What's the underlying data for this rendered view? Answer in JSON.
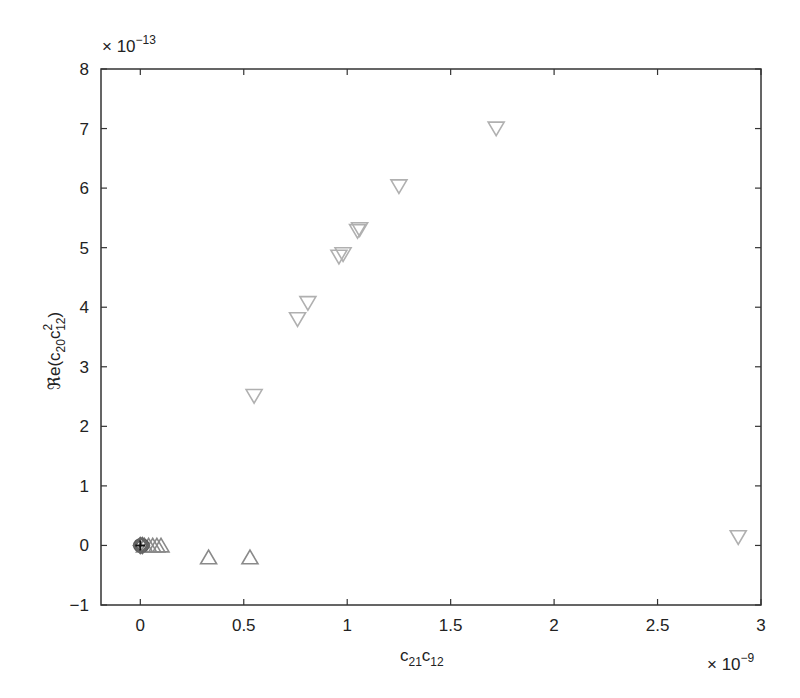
{
  "chart_data": {
    "type": "scatter",
    "title": "",
    "xlabel": "c21c12",
    "xlabel_parts": {
      "base1": "c",
      "sub1": "21",
      "base2": "c",
      "sub2": "12"
    },
    "ylabel": "Re(c20c^2_12)",
    "ylabel_parts": {
      "prefix": "ℜe(c",
      "sub1": "20",
      "base2": "c",
      "sup2": "2",
      "sub2": "12",
      "suffix": ")"
    },
    "x_multiplier": "× 10",
    "x_multiplier_exp": "−9",
    "y_multiplier": "× 10",
    "y_multiplier_exp": "−13",
    "xlim": [
      -0.19,
      3.0
    ],
    "ylim": [
      -1,
      8
    ],
    "xticks": [
      0,
      0.5,
      1,
      1.5,
      2,
      2.5,
      3
    ],
    "xtick_labels": [
      "0",
      "0.5",
      "1",
      "1.5",
      "2",
      "2.5",
      "3"
    ],
    "yticks": [
      -1,
      0,
      1,
      2,
      3,
      4,
      5,
      6,
      7,
      8
    ],
    "ytick_labels": [
      "−1",
      "0",
      "1",
      "2",
      "3",
      "4",
      "5",
      "6",
      "7",
      "8"
    ],
    "grid": false,
    "legend": null,
    "series": [
      {
        "name": "down-triangles",
        "marker": "triangle-down",
        "color": "#b0b0b0",
        "points": [
          [
            0.55,
            2.51
          ],
          [
            0.76,
            3.8
          ],
          [
            0.81,
            4.07
          ],
          [
            0.96,
            4.85
          ],
          [
            0.98,
            4.89
          ],
          [
            1.05,
            5.28
          ],
          [
            1.06,
            5.31
          ],
          [
            1.25,
            6.03
          ],
          [
            1.72,
            7.0
          ],
          [
            2.89,
            0.14
          ]
        ]
      },
      {
        "name": "up-triangles",
        "marker": "triangle-up",
        "color": "#8a8a8a",
        "points": [
          [
            0.02,
            0.0
          ],
          [
            0.04,
            0.0
          ],
          [
            0.06,
            0.0
          ],
          [
            0.08,
            0.0
          ],
          [
            0.1,
            0.0
          ],
          [
            0.33,
            -0.2
          ],
          [
            0.53,
            -0.2
          ]
        ]
      },
      {
        "name": "circles",
        "marker": "circle",
        "color": "#555555",
        "points": [
          [
            0.0,
            0.0
          ],
          [
            0.005,
            0.0
          ],
          [
            0.01,
            0.0
          ]
        ]
      },
      {
        "name": "diamonds",
        "marker": "diamond",
        "color": "#666666",
        "points": [
          [
            0.0,
            0.0
          ],
          [
            0.01,
            0.0
          ]
        ]
      },
      {
        "name": "plus",
        "marker": "plus",
        "color": "#111111",
        "points": [
          [
            0.0,
            0.0
          ]
        ]
      }
    ]
  }
}
